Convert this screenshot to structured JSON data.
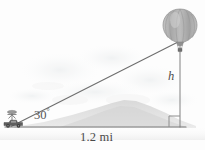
{
  "figure": {
    "labels": {
      "angle_value": "30",
      "angle_degree_symbol": "°",
      "height_label": "h",
      "base_label": "1.2 mi"
    },
    "colors": {
      "background": "#fdfdfd",
      "line": "#6e6e6e",
      "baseline": "#7a7a7a",
      "balloon_fill": "#b4b4b4",
      "balloon_stripe": "#9a9a9a",
      "balloon_outline": "#8a8a8a",
      "mountain": "#dcdcdc",
      "cloud": "#f1f1f1",
      "vehicle": "#5a5a5a",
      "text": "#4a4a4a"
    },
    "geometry": {
      "observer_x": 10,
      "observer_y": 127,
      "balloon_base_x": 180,
      "balloon_base_y": 127,
      "balloon_top_y": 40,
      "baseline_start_x": 5,
      "baseline_end_x": 185,
      "angle_degrees": 30
    },
    "elements": {
      "balloon_name": "hot-air-balloon",
      "vehicle_name": "observer-vehicle",
      "mountain_name": "mountain-silhouette",
      "sight_line_name": "line-of-sight",
      "height_line_name": "height-line",
      "baseline_name": "ground-baseline",
      "right_angle_name": "right-angle-mark"
    }
  }
}
